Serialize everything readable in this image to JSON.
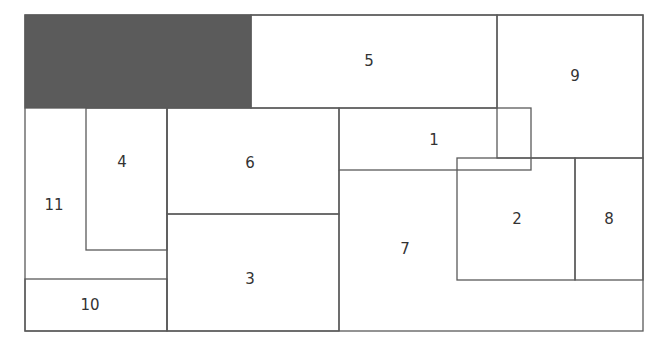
{
  "diagram": {
    "type": "rectangle-packing / floorplan",
    "colors": {
      "line": "#5a5a5a",
      "filled_block": "#5b5b5b",
      "background": "#ffffff",
      "label": "#333333"
    },
    "filled_block": {
      "label": "",
      "x": 25,
      "y": 15,
      "w": 226,
      "h": 93
    },
    "blocks": [
      {
        "id": "1",
        "label": "1",
        "lx": 434,
        "ly": 140
      },
      {
        "id": "2",
        "label": "2",
        "lx": 517,
        "ly": 219
      },
      {
        "id": "3",
        "label": "3",
        "lx": 250,
        "ly": 279
      },
      {
        "id": "4",
        "label": "4",
        "lx": 122,
        "ly": 162
      },
      {
        "id": "5",
        "label": "5",
        "lx": 369,
        "ly": 61
      },
      {
        "id": "6",
        "label": "6",
        "lx": 250,
        "ly": 163
      },
      {
        "id": "7",
        "label": "7",
        "lx": 405,
        "ly": 249
      },
      {
        "id": "8",
        "label": "8",
        "lx": 609,
        "ly": 219
      },
      {
        "id": "9",
        "label": "9",
        "lx": 575,
        "ly": 76
      },
      {
        "id": "10",
        "label": "10",
        "lx": 90,
        "ly": 305
      },
      {
        "id": "11",
        "label": "11",
        "lx": 54,
        "ly": 205
      }
    ]
  }
}
